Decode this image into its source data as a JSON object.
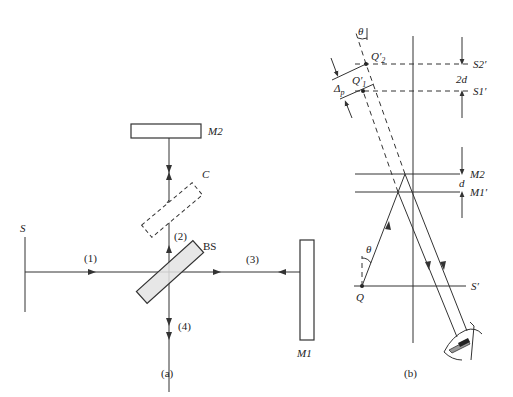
{
  "figure": {
    "panel_a": {
      "caption": "(a)",
      "source_label": "S",
      "mirror2_label": "M2",
      "mirror1_label": "M1",
      "compensator_label": "C",
      "beamsplitter_label": "BS",
      "beam_labels": [
        "(1)",
        "(2)",
        "(3)",
        "(4)"
      ]
    },
    "panel_b": {
      "caption": "(b)",
      "theta_top": "θ",
      "q2_label": "Q′",
      "q2_sub": "2",
      "q1_label": "Q′",
      "q1_sub": "1",
      "delta_label": "Δ",
      "delta_sub": "p",
      "s2_label": "S2′",
      "s1_label": "S1′",
      "two_d_label": "2d",
      "m2_label": "M2",
      "d_label": "d",
      "m1p_label": "M1′",
      "theta_bottom": "θ",
      "q_label": "Q",
      "sprime_label": "S′"
    }
  }
}
